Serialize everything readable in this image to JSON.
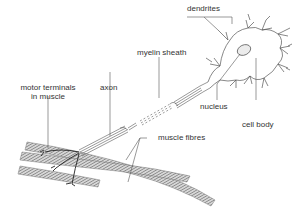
{
  "diagram": {
    "labels": {
      "dendrites": "dendrites",
      "myelin_sheath": "myelin sheath",
      "axon": "axon",
      "motor_terminals_line1": "motor terminals",
      "motor_terminals_line2": "in muscle",
      "nucleus": "nucleus",
      "cell_body": "cell body",
      "muscle_fibres": "muscle fibres"
    },
    "colors": {
      "line": "#555555",
      "muscle_fill": "#9a9a9a",
      "nucleus_fill": "#ececec",
      "text": "#333333"
    }
  }
}
